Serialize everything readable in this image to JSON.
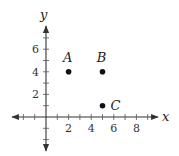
{
  "chart_data": {
    "type": "scatter",
    "title": "",
    "xlabel": "x",
    "ylabel": "y",
    "xlim": [
      -3,
      10
    ],
    "ylim": [
      -3,
      8
    ],
    "x_ticks": [
      -2,
      -1,
      1,
      2,
      3,
      4,
      5,
      6,
      7,
      8,
      9
    ],
    "y_ticks": [
      -2,
      -1,
      1,
      2,
      3,
      4,
      5,
      6,
      7
    ],
    "x_tick_labels": [
      "2",
      "4",
      "6",
      "8"
    ],
    "y_tick_labels": [
      "2",
      "4",
      "6"
    ],
    "grid": false,
    "points": [
      {
        "label": "A",
        "x": 2,
        "y": 4
      },
      {
        "label": "B",
        "x": 5,
        "y": 4
      },
      {
        "label": "C",
        "x": 5,
        "y": 1
      }
    ]
  },
  "colors": {
    "axis": "#333333",
    "point": "#111111"
  }
}
